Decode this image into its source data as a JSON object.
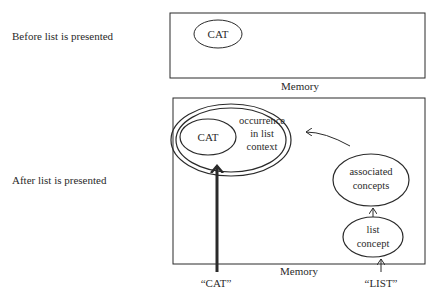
{
  "rows": {
    "before": {
      "label": "Before list  is presented"
    },
    "after": {
      "label": "After list  is presented"
    }
  },
  "before_panel": {
    "memory_label": "Memory",
    "node_cat": "CAT"
  },
  "after_panel": {
    "memory_label": "Memory",
    "node_cat": "CAT",
    "occurrence": {
      "line1": "occurrence",
      "line2": "in  list",
      "line3": "context"
    },
    "associated": {
      "line1": "associated",
      "line2": "concepts"
    },
    "list_concept": {
      "line1": "list",
      "line2": "concept"
    },
    "input_cat": "“CAT”",
    "input_list": "“LIST”"
  },
  "colors": {
    "ink": "#2a2a2a",
    "background": "#ffffff"
  }
}
